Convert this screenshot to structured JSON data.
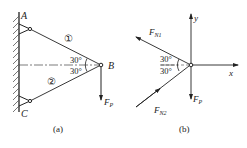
{
  "figure_a": {
    "caption": "(a)",
    "point_a": "A",
    "point_b": "B",
    "point_c": "C",
    "member_1": "①",
    "member_2": "②",
    "angle_upper": "30°",
    "angle_lower": "30°",
    "force": "F",
    "force_sub": "P"
  },
  "figure_b": {
    "caption": "(b)",
    "axis_x": "x",
    "axis_y": "y",
    "force_n1": "F",
    "force_n1_sub": "N1",
    "force_n2": "F",
    "force_n2_sub": "N2",
    "force_p": "F",
    "force_p_sub": "P",
    "angle_upper": "30°",
    "angle_lower": "30°"
  },
  "colors": {
    "ink": "#222222",
    "background": "#ffffff"
  }
}
